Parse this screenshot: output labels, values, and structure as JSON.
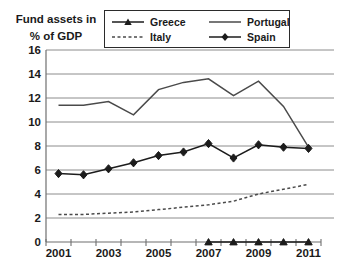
{
  "chart_data": {
    "type": "line",
    "title": "Fund assets in % of GDP",
    "title_lines": [
      "Fund assets in",
      "% of GDP"
    ],
    "x": [
      2001,
      2002,
      2003,
      2004,
      2005,
      2006,
      2007,
      2008,
      2009,
      2010,
      2011
    ],
    "x_tick_labels": [
      "2001",
      "2003",
      "2005",
      "2007",
      "2009",
      "2011"
    ],
    "ylim": [
      0,
      16
    ],
    "ytick_step": 2,
    "grid": true,
    "legend_position": "top-center",
    "colors": {
      "grid": "#8c8c8c",
      "axis": "#6f6f6f",
      "text": "#1a1a1a",
      "background": "#ffffff"
    },
    "series": [
      {
        "name": "Greece",
        "marker": "triangle",
        "dash": "solid",
        "color": "#1c1c1c",
        "values": [
          null,
          null,
          null,
          null,
          null,
          null,
          0,
          0,
          0,
          0,
          0
        ]
      },
      {
        "name": "Portugal",
        "marker": "none",
        "dash": "solid",
        "color": "#4a4a4a",
        "values": [
          11.4,
          11.4,
          11.7,
          10.6,
          12.7,
          13.3,
          13.6,
          12.2,
          13.4,
          11.3,
          7.9
        ]
      },
      {
        "name": "Italy",
        "marker": "none",
        "dash": "dashed",
        "color": "#4a4a4a",
        "values": [
          2.3,
          2.3,
          2.4,
          2.5,
          2.7,
          2.9,
          3.1,
          3.4,
          4.0,
          4.4,
          4.8
        ]
      },
      {
        "name": "Spain",
        "marker": "diamond",
        "dash": "solid",
        "color": "#1c1c1c",
        "values": [
          5.7,
          5.6,
          6.1,
          6.6,
          7.2,
          7.5,
          8.2,
          7.0,
          8.1,
          7.9,
          7.8
        ]
      }
    ]
  }
}
